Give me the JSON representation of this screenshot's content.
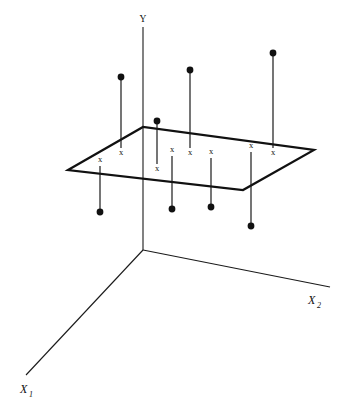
{
  "figure": {
    "title": "",
    "type": "3d-regression-plane-scatter",
    "background_color": "#ffffff",
    "ink_color": "#111111",
    "width": 349,
    "height": 416
  },
  "axes": {
    "vertical": {
      "name": "y-axis",
      "label": "Y",
      "label_x": 143,
      "label_y": 22,
      "from": [
        143,
        250
      ],
      "to": [
        143,
        27
      ]
    },
    "depth_right": {
      "name": "x2-axis",
      "label": "X",
      "subscript": "2",
      "label_x": 310,
      "label_y": 303,
      "from": [
        143,
        250
      ],
      "to": [
        330,
        287
      ]
    },
    "depth_left": {
      "name": "x1-axis",
      "label": "X",
      "subscript": "1",
      "label_x": 22,
      "label_y": 392,
      "from": [
        143,
        250
      ],
      "to": [
        26,
        375
      ]
    }
  },
  "plane": {
    "name": "regression-plane",
    "corners": [
      [
        68,
        170
      ],
      [
        143,
        127
      ],
      [
        314,
        150
      ],
      [
        243,
        190
      ]
    ],
    "stroke_color": "#111111",
    "stroke_width": 2.2
  },
  "observations": [
    {
      "id": "obs-1",
      "xmark": [
        100,
        162
      ],
      "stem_from": [
        100,
        166
      ],
      "stem_to": [
        100,
        212
      ],
      "point": [
        100,
        212
      ],
      "direction": "below"
    },
    {
      "id": "obs-2",
      "xmark": [
        121,
        152
      ],
      "stem_from": [
        121,
        148
      ],
      "stem_to": [
        121,
        80
      ],
      "point": [
        121,
        77
      ],
      "direction": "above"
    },
    {
      "id": "obs-3",
      "xmark": [
        157,
        168
      ],
      "stem_from": [
        157,
        164
      ],
      "stem_to": [
        157,
        124
      ],
      "point": [
        157,
        121
      ],
      "direction": "above"
    },
    {
      "id": "obs-4",
      "xmark": [
        172,
        152
      ],
      "stem_from": [
        172,
        156
      ],
      "stem_to": [
        172,
        208
      ],
      "point": [
        172,
        209
      ],
      "direction": "below"
    },
    {
      "id": "obs-5",
      "xmark": [
        190,
        152
      ],
      "stem_from": [
        190,
        148
      ],
      "stem_to": [
        190,
        73
      ],
      "point": [
        190,
        70
      ],
      "direction": "above"
    },
    {
      "id": "obs-6",
      "xmark": [
        211,
        154
      ],
      "stem_from": [
        211,
        158
      ],
      "stem_to": [
        211,
        206
      ],
      "point": [
        211,
        207
      ],
      "direction": "below"
    },
    {
      "id": "obs-7",
      "xmark": [
        251,
        148
      ],
      "stem_from": [
        251,
        152
      ],
      "stem_to": [
        251,
        225
      ],
      "point": [
        251,
        226
      ],
      "direction": "below"
    },
    {
      "id": "obs-8",
      "xmark": [
        273,
        152
      ],
      "stem_from": [
        273,
        148
      ],
      "stem_to": [
        273,
        56
      ],
      "point": [
        273,
        53
      ],
      "direction": "above"
    }
  ],
  "marks": {
    "observed_point_symbol": "filled-circle",
    "fitted_value_symbol": "x",
    "fitted_label": "x",
    "point_radius": 3.4
  },
  "legend": {
    "visible": false
  }
}
